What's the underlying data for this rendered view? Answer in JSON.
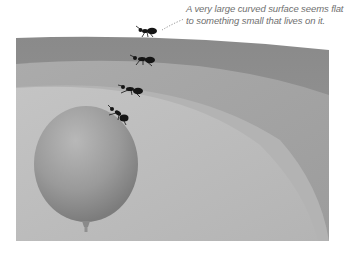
{
  "caption": {
    "line1": "A very large curved surface seems flat",
    "line2": "to something small that lives on it."
  },
  "illustration": {
    "surfaces": [
      {
        "name": "very-large-surface",
        "color": "#8e8e8e"
      },
      {
        "name": "large-surface",
        "color": "#a3a3a3"
      },
      {
        "name": "medium-surface",
        "color": "#b9b9b9"
      },
      {
        "name": "small-surface",
        "color": "#c9c9c9"
      }
    ],
    "balloon_color": "#9a9a9a",
    "ant_count": 4,
    "ant_color": "#151515"
  }
}
